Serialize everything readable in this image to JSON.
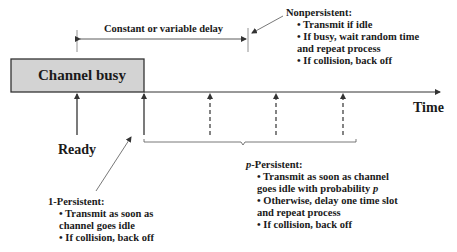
{
  "diagram": {
    "channel_busy_label": "Channel busy",
    "ready_label": "Ready",
    "time_label": "Time",
    "delay_label": "Constant or variable delay",
    "colors": {
      "busy_fill": "#d3d3d3",
      "line": "#333333",
      "text": "#1a1a1a"
    },
    "nonpersistent": {
      "title": "Nonpersistent:",
      "items": [
        "• Transmit if idle",
        "• If busy, wait random time",
        "and repeat process",
        "• If collision, back off"
      ]
    },
    "one_persistent": {
      "title": "1-Persistent:",
      "items": [
        "• Transmit as soon as",
        "channel goes idle",
        "• If collision, back off"
      ]
    },
    "p_persistent": {
      "title_italic": "p",
      "title_rest": "-Persistent:",
      "items": [
        "• Transmit as soon as channel",
        "goes idle with probability ",
        "• Otherwise, delay one time slot",
        "and repeat process",
        "• If collision, back off"
      ],
      "prob_symbol": "p"
    }
  }
}
